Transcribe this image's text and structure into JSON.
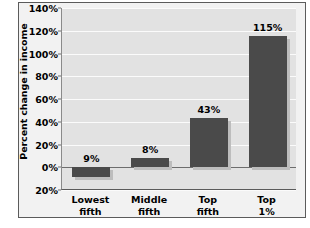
{
  "chart_data": {
    "type": "bar",
    "title": "",
    "xlabel": "",
    "ylabel": "Percent change in income",
    "categories": [
      "Lowest fifth",
      "Middle fifth",
      "Top fifth",
      "Top 1%"
    ],
    "category_lines": [
      [
        "Lowest",
        "fifth"
      ],
      [
        "Middle",
        "fifth"
      ],
      [
        "Top",
        "fifth"
      ],
      [
        "Top",
        "1%"
      ]
    ],
    "values": [
      -9,
      8,
      43,
      115
    ],
    "value_labels": [
      "9%",
      "8%",
      "43%",
      "115%"
    ],
    "ylim": [
      -20,
      140
    ],
    "ytick_values": [
      140,
      120,
      100,
      80,
      60,
      40,
      20,
      0,
      -20
    ],
    "ytick_labels": [
      "140%",
      "120%",
      "100%",
      "80%",
      "60%",
      "40%",
      "20%",
      "0%",
      "20%"
    ],
    "grid": true,
    "legend": "none",
    "colors": {
      "bar": "#4a4a4a",
      "bar_shadow": "#bdbdbd",
      "plot_background": "#e2e2e2",
      "figure_background": "#f2f2f2",
      "gridline": "#fbfbfb",
      "zero_line": "#6d6d6d",
      "axis": "#5b5b5b",
      "text": "#000000"
    }
  }
}
